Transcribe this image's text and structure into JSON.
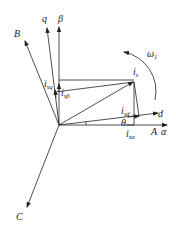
{
  "diagram": {
    "type": "vector-diagram",
    "axes": {
      "A": "A",
      "B": "B",
      "C": "C",
      "alpha": "α",
      "beta": "β",
      "d": "d",
      "q": "q"
    },
    "vectors": {
      "is": {
        "main": "i",
        "sub": "s"
      },
      "isd": {
        "main": "i",
        "sub": "sd"
      },
      "isq": {
        "main": "i",
        "sub": "sq"
      },
      "isalpha": {
        "main": "i",
        "sub": "sα"
      },
      "isbeta": {
        "main": "i",
        "sub": "sβ"
      }
    },
    "angle": "θ",
    "rotation": {
      "main": "ω",
      "sub": "1"
    },
    "colors": {
      "line": "#222222",
      "background": "#ffffff"
    }
  }
}
